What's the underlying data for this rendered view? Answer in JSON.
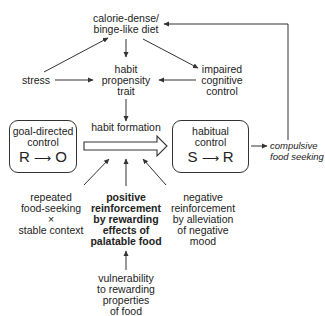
{
  "diagram": {
    "nodes": {
      "diet": {
        "lines": [
          "calorie-dense/",
          "binge-like diet"
        ]
      },
      "stress": {
        "lines": [
          "stress"
        ]
      },
      "trait": {
        "lines": [
          "habit",
          "propensity",
          "trait"
        ]
      },
      "cognitive": {
        "lines": [
          "impaired",
          "cognitive",
          "control"
        ]
      },
      "habit_formation": {
        "lines": [
          "habit formation"
        ]
      },
      "goal_box": {
        "lines": [
          "goal-directed",
          "control"
        ],
        "formula": {
          "left": "R",
          "arrow": "⟶",
          "right": "O"
        }
      },
      "habit_box": {
        "lines": [
          "habitual",
          "control"
        ],
        "formula": {
          "left": "S",
          "arrow": "⟶",
          "right": "R"
        }
      },
      "compulsive": {
        "lines": [
          "compulsive",
          "food seeking"
        ]
      },
      "repeated": {
        "lines": [
          "repeated",
          "food-seeking",
          "×",
          "stable context"
        ]
      },
      "positive": {
        "lines": [
          "positive",
          "reinforcement",
          "by rewarding",
          "effects of",
          "palatable food"
        ]
      },
      "negative": {
        "lines": [
          "negative",
          "reinforcement",
          "by alleviation",
          "of negative",
          "mood"
        ]
      },
      "vulnerability": {
        "lines": [
          "vulnerability",
          "to rewarding",
          "properties",
          "of food"
        ]
      }
    },
    "edges": [
      {
        "from": "stress",
        "to": "diet"
      },
      {
        "from": "diet",
        "to": "trait"
      },
      {
        "from": "diet",
        "to": "cognitive"
      },
      {
        "from": "stress",
        "to": "trait"
      },
      {
        "from": "cognitive",
        "to": "trait"
      },
      {
        "from": "trait",
        "to": "habit_formation"
      },
      {
        "from": "goal_box",
        "to": "habit_box",
        "style": "hollow-block-arrow"
      },
      {
        "from": "repeated",
        "to": "habit_formation"
      },
      {
        "from": "positive",
        "to": "habit_formation"
      },
      {
        "from": "negative",
        "to": "habit_formation"
      },
      {
        "from": "vulnerability",
        "to": "positive"
      },
      {
        "from": "habit_box",
        "to": "compulsive"
      },
      {
        "from": "compulsive",
        "to": "diet",
        "style": "feedback-loop"
      }
    ],
    "colors": {
      "line": "#333333",
      "text": "#222222",
      "background": "#ffffff"
    }
  }
}
